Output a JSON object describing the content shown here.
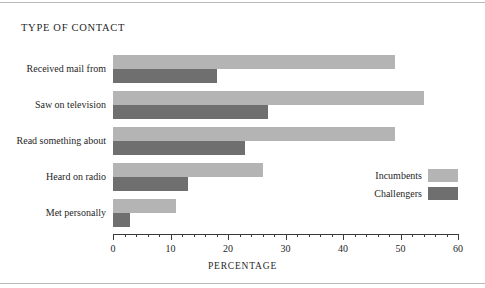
{
  "chart_data": {
    "type": "bar",
    "orientation": "horizontal",
    "title": "TYPE OF CONTACT",
    "xlabel": "PERCENTAGE",
    "ylabel": "",
    "xlim": [
      0,
      60
    ],
    "xticks": [
      0,
      10,
      20,
      30,
      40,
      50,
      60
    ],
    "xtick_labels": [
      "0",
      "10",
      "20",
      "30",
      "40",
      "50",
      "60"
    ],
    "minor_tick_step": 2,
    "grid": false,
    "legend_position": "center-right",
    "categories": [
      "Received mail from",
      "Saw on television",
      "Read something about",
      "Heard on radio",
      "Met personally"
    ],
    "series": [
      {
        "name": "Incumbents",
        "color": "#b4b4b4",
        "values": [
          49,
          54,
          49,
          26,
          11
        ]
      },
      {
        "name": "Challengers",
        "color": "#6f6f6f",
        "values": [
          18,
          27,
          23,
          13,
          3
        ]
      }
    ]
  },
  "legend": {
    "items": [
      {
        "label": "Incumbents",
        "color": "#b4b4b4"
      },
      {
        "label": "Challengers",
        "color": "#6f6f6f"
      }
    ]
  }
}
